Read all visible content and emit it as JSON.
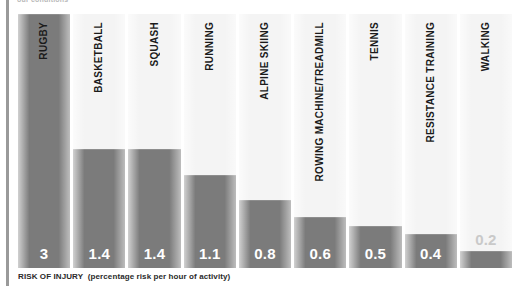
{
  "top_caption": "our conditions",
  "axis_caption": {
    "main": "RISK OF INJURY",
    "sub": "(percentage risk per hour of activity)"
  },
  "colors": {
    "bar_fill": "#7b7b7b",
    "column_background": "#f4f4f4",
    "value_text": "#ffffff",
    "value_text_muted": "#c9c9c9",
    "category_text": "#1b1b1b",
    "left_rule": "#9a9a9a",
    "page_background": "#ffffff"
  },
  "chart_data": {
    "type": "bar",
    "title": "",
    "xlabel": "RISK OF INJURY (percentage risk per hour of activity)",
    "ylabel": "",
    "ylim": [
      0,
      3
    ],
    "grid": false,
    "legend": null,
    "orientation": "vertical",
    "categories": [
      "RUGBY",
      "BASKETBALL",
      "SQUASH",
      "RUNNING",
      "ALPINE SKIING",
      "ROWING MACHINE/TREADMILL",
      "TENNIS",
      "RESISTANCE TRAINING",
      "WALKING"
    ],
    "values": [
      3,
      1.4,
      1.4,
      1.1,
      0.8,
      0.6,
      0.5,
      0.4,
      0.2
    ],
    "value_labels": [
      "3",
      "1.4",
      "1.4",
      "1.1",
      "0.8",
      "0.6",
      "0.5",
      "0.4",
      "0.2"
    ],
    "bars": [
      {
        "category": "RUGBY",
        "value": 3,
        "label": "3",
        "muted_label": false
      },
      {
        "category": "BASKETBALL",
        "value": 1.4,
        "label": "1.4",
        "muted_label": false
      },
      {
        "category": "SQUASH",
        "value": 1.4,
        "label": "1.4",
        "muted_label": false
      },
      {
        "category": "RUNNING",
        "value": 1.1,
        "label": "1.1",
        "muted_label": false
      },
      {
        "category": "ALPINE SKIING",
        "value": 0.8,
        "label": "0.8",
        "muted_label": false
      },
      {
        "category": "ROWING MACHINE/TREADMILL",
        "value": 0.6,
        "label": "0.6",
        "muted_label": false
      },
      {
        "category": "TENNIS",
        "value": 0.5,
        "label": "0.5",
        "muted_label": false
      },
      {
        "category": "RESISTANCE TRAINING",
        "value": 0.4,
        "label": "0.4",
        "muted_label": false
      },
      {
        "category": "WALKING",
        "value": 0.2,
        "label": "0.2",
        "muted_label": true
      }
    ]
  }
}
